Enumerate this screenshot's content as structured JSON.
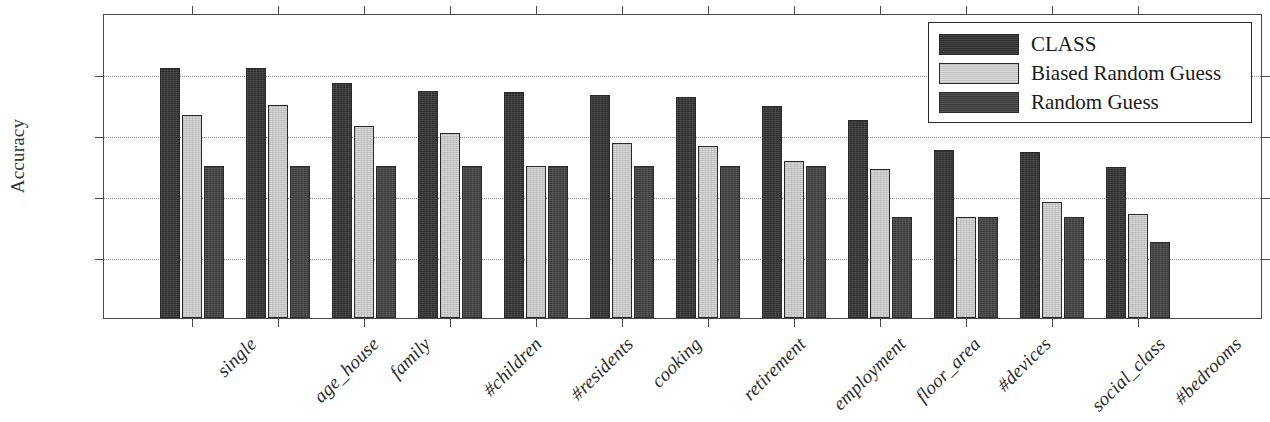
{
  "chart_data": {
    "type": "bar",
    "title": "",
    "xlabel": "",
    "ylabel": "Accuracy",
    "ylim": [
      0,
      100
    ],
    "yticks": [
      0,
      20,
      40,
      60,
      80,
      100
    ],
    "ytick_labels": [
      "0%",
      "20%",
      "40%",
      "60%",
      "80%",
      "100%"
    ],
    "grid": "horizontal-dotted",
    "legend_position": "upper-right",
    "categories": [
      "single",
      "age_house",
      "family",
      "#children",
      "#residents",
      "cooking",
      "retirement",
      "employment",
      "floor_area",
      "#devices",
      "social_class",
      "#bedrooms"
    ],
    "series": [
      {
        "name": "CLASS",
        "color": "#2d2d2d",
        "values": [
          82,
          82,
          77,
          74.5,
          74,
          73,
          72.5,
          69.5,
          65,
          55,
          54.5,
          49.5
        ]
      },
      {
        "name": "Biased Random Guess",
        "color": "#d9d9d9",
        "values": [
          66.5,
          70,
          63,
          60.5,
          50,
          57.5,
          56.5,
          51.5,
          49,
          33,
          38,
          34
        ]
      },
      {
        "name": "Random Guess",
        "color": "#3b3b3b",
        "values": [
          50,
          50,
          50,
          50,
          50,
          50,
          50,
          50,
          33,
          33,
          33,
          25
        ]
      }
    ]
  },
  "legend": {
    "entries": [
      {
        "label": "CLASS"
      },
      {
        "label": "Biased Random Guess"
      },
      {
        "label": "Random Guess"
      }
    ]
  }
}
